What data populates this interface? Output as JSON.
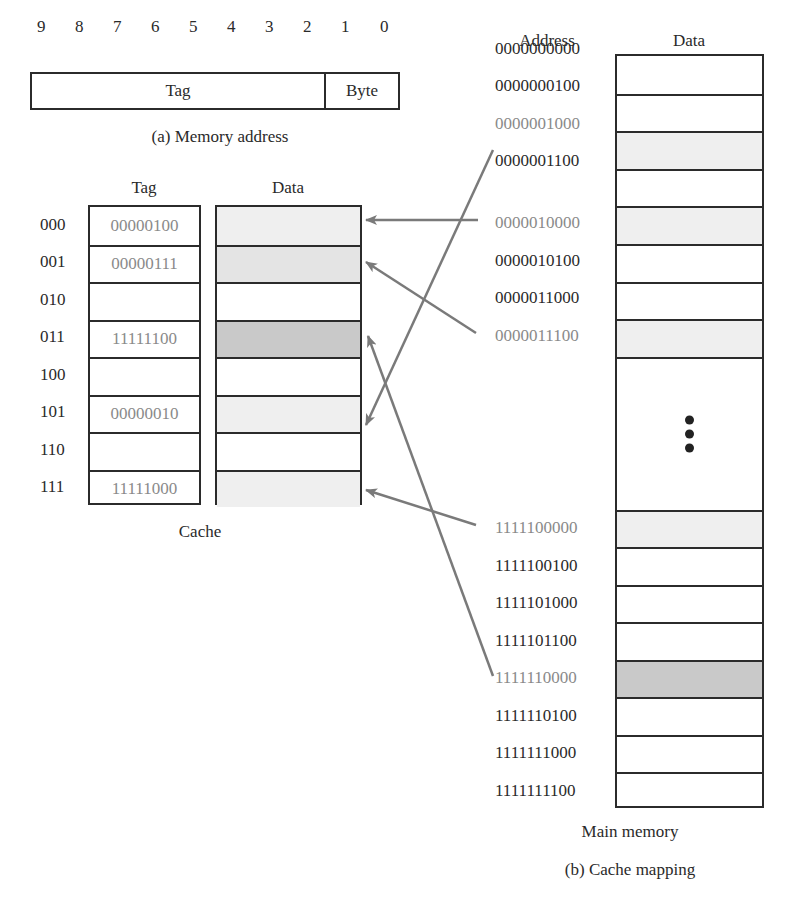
{
  "memory_address": {
    "bit_labels": [
      "9",
      "8",
      "7",
      "6",
      "5",
      "4",
      "3",
      "2",
      "1",
      "0"
    ],
    "fields": [
      {
        "name": "Tag",
        "bits": "9-2"
      },
      {
        "name": "Byte",
        "bits": "1-0"
      }
    ],
    "caption": "(a) Memory address"
  },
  "cache": {
    "tag_header": "Tag",
    "data_header": "Data",
    "caption": "Cache",
    "lines": [
      {
        "index": "000",
        "tag": "00000100",
        "fill": "#efefef"
      },
      {
        "index": "001",
        "tag": "00000111",
        "fill": "#e4e4e4"
      },
      {
        "index": "010",
        "tag": "",
        "fill": "#ffffff"
      },
      {
        "index": "011",
        "tag": "11111100",
        "fill": "#c9c9c9"
      },
      {
        "index": "100",
        "tag": "",
        "fill": "#ffffff"
      },
      {
        "index": "101",
        "tag": "00000010",
        "fill": "#efefef"
      },
      {
        "index": "110",
        "tag": "",
        "fill": "#ffffff"
      },
      {
        "index": "111",
        "tag": "11111000",
        "fill": "#efefef"
      }
    ]
  },
  "main_memory": {
    "address_header": "Address",
    "data_header": "Data",
    "caption": "Main memory",
    "ellipsis": "⋮",
    "top_rows": [
      {
        "address": "0000000000",
        "highlight": false,
        "fill": "#ffffff"
      },
      {
        "address": "0000000100",
        "highlight": false,
        "fill": "#ffffff"
      },
      {
        "address": "0000001000",
        "highlight": true,
        "fill": "#efefef"
      },
      {
        "address": "0000001100",
        "highlight": false,
        "fill": "#ffffff"
      },
      {
        "address": "0000010000",
        "highlight": true,
        "fill": "#efefef"
      },
      {
        "address": "0000010100",
        "highlight": false,
        "fill": "#ffffff"
      },
      {
        "address": "0000011000",
        "highlight": false,
        "fill": "#ffffff"
      },
      {
        "address": "0000011100",
        "highlight": true,
        "fill": "#efefef"
      }
    ],
    "bottom_rows": [
      {
        "address": "1111100000",
        "highlight": true,
        "fill": "#efefef"
      },
      {
        "address": "1111100100",
        "highlight": false,
        "fill": "#ffffff"
      },
      {
        "address": "1111101000",
        "highlight": false,
        "fill": "#ffffff"
      },
      {
        "address": "1111101100",
        "highlight": false,
        "fill": "#ffffff"
      },
      {
        "address": "1111110000",
        "highlight": true,
        "fill": "#c9c9c9"
      },
      {
        "address": "1111110100",
        "highlight": false,
        "fill": "#ffffff"
      },
      {
        "address": "1111111000",
        "highlight": false,
        "fill": "#ffffff"
      },
      {
        "address": "1111111100",
        "highlight": false,
        "fill": "#ffffff"
      }
    ]
  },
  "mappings": [
    {
      "from": "0000001000",
      "to_line": "101"
    },
    {
      "from": "0000010000",
      "to_line": "000"
    },
    {
      "from": "0000011100",
      "to_line": "001"
    },
    {
      "from": "1111100000",
      "to_line": "111"
    },
    {
      "from": "1111110000",
      "to_line": "011"
    }
  ],
  "caption": "(b) Cache mapping",
  "colors": {
    "line": "#2b2b2b",
    "arrow": "#7a7a7a",
    "text": "#2a2a2a",
    "grey_text": "#8a8a8a"
  }
}
